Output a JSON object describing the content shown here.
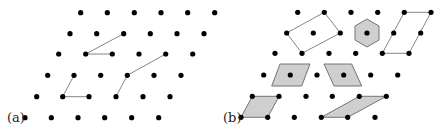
{
  "figure": {
    "width": 445,
    "height": 130,
    "panels": [
      {
        "id": "a",
        "label": "(a)",
        "label_pos": [
          7,
          122
        ],
        "lattice": {
          "rows": [
            {
              "y": 12.7,
              "x": [
                80.7,
                107.3,
                134.3,
                161.0,
                187.7,
                214.7
              ]
            },
            {
              "y": 33.7,
              "x": [
                70.0,
                96.7,
                123.7,
                150.3,
                177.0,
                204.0
              ]
            },
            {
              "y": 54.0,
              "x": [
                58.7,
                85.7,
                112.3,
                139.0,
                165.7,
                192.7
              ]
            },
            {
              "y": 75.3,
              "x": [
                47.7,
                74.0,
                100.7,
                127.3,
                154.0,
                181.0
              ]
            },
            {
              "y": 96.7,
              "x": [
                36.7,
                62.7,
                89.0,
                116.0,
                143.0,
                170.0
              ]
            },
            {
              "y": 117.7,
              "x": [
                25.0,
                51.3,
                78.0,
                104.7,
                131.7,
                158.7
              ]
            }
          ]
        },
        "segments": [
          {
            "from": [
              85.7,
              54.0
            ],
            "to": [
              123.7,
              33.7
            ]
          },
          {
            "from": [
              85.7,
              54.0
            ],
            "to": [
              112.3,
              54.0
            ]
          },
          {
            "from": [
              62.7,
              96.7
            ],
            "to": [
              74.0,
              75.3
            ]
          },
          {
            "from": [
              62.7,
              96.7
            ],
            "to": [
              89.0,
              96.7
            ]
          },
          {
            "from": [
              116.0,
              96.7
            ],
            "to": [
              127.3,
              75.3
            ]
          },
          {
            "from": [
              127.3,
              75.3
            ],
            "to": [
              165.7,
              54.0
            ]
          }
        ],
        "polygons": []
      },
      {
        "id": "b",
        "label": "(b)",
        "label_pos": [
          223,
          122
        ],
        "lattice": {
          "rows": [
            {
              "y": 12.3,
              "x": [
                297.7,
                324.3,
                351.0,
                377.7,
                404.3,
                431.0
              ]
            },
            {
              "y": 33.0,
              "x": [
                286.7,
                313.3,
                340.3,
                367.0,
                393.7,
                420.7
              ]
            },
            {
              "y": 53.3,
              "x": [
                275.0,
                302.0,
                329.0,
                355.7,
                382.3,
                409.0
              ]
            },
            {
              "y": 75.0,
              "x": [
                263.7,
                290.3,
                317.0,
                343.7,
                370.7,
                397.7
              ]
            },
            {
              "y": 96.3,
              "x": [
                252.3,
                279.0,
                306.0,
                332.3,
                359.3,
                386.3
              ]
            },
            {
              "y": 117.3,
              "x": [
                241.0,
                267.7,
                294.3,
                321.3,
                347.7,
                375.0
              ]
            }
          ]
        },
        "segments": [],
        "polygons": [
          {
            "name": "parallelogram-outline-top-left",
            "style": "outline",
            "points": [
              [
                324.3,
                12.3
              ],
              [
                340.3,
                33.0
              ],
              [
                302.0,
                53.3
              ],
              [
                286.7,
                33.0
              ]
            ]
          },
          {
            "name": "hexagon-filled",
            "style": "filled",
            "points": [
              [
                367.0,
                19.0
              ],
              [
                379.0,
                26.0
              ],
              [
                379.0,
                40.0
              ],
              [
                367.0,
                47.0
              ],
              [
                355.0,
                40.0
              ],
              [
                355.0,
                26.0
              ]
            ]
          },
          {
            "name": "parallelogram-outline-top-right",
            "style": "outline",
            "points": [
              [
                404.3,
                12.3
              ],
              [
                431.0,
                12.3
              ],
              [
                409.0,
                53.3
              ],
              [
                382.3,
                53.3
              ]
            ]
          },
          {
            "name": "rhombus-filled-left",
            "style": "filled",
            "points": [
              [
                280.0,
                64.0
              ],
              [
                310.0,
                64.0
              ],
              [
                301.7,
                86.0
              ],
              [
                271.7,
                86.0
              ]
            ]
          },
          {
            "name": "rhombus-filled-right",
            "style": "filled",
            "points": [
              [
                324.0,
                64.0
              ],
              [
                351.7,
                64.0
              ],
              [
                361.7,
                86.0
              ],
              [
                334.0,
                86.0
              ]
            ]
          },
          {
            "name": "parallelogram-filled-bottom-left",
            "style": "filled",
            "points": [
              [
                252.3,
                96.3
              ],
              [
                279.0,
                96.3
              ],
              [
                267.7,
                117.3
              ],
              [
                241.0,
                117.3
              ]
            ]
          },
          {
            "name": "parallelogram-filled-bottom-right",
            "style": "filled",
            "points": [
              [
                359.3,
                96.3
              ],
              [
                386.3,
                96.3
              ],
              [
                347.7,
                117.3
              ],
              [
                321.3,
                117.3
              ]
            ]
          }
        ]
      }
    ],
    "dot_radius": 2.6,
    "colors": {
      "dot": "#000000",
      "line": "#777777",
      "fill": "#cfcfcf",
      "fill_stroke": "#666666"
    }
  }
}
